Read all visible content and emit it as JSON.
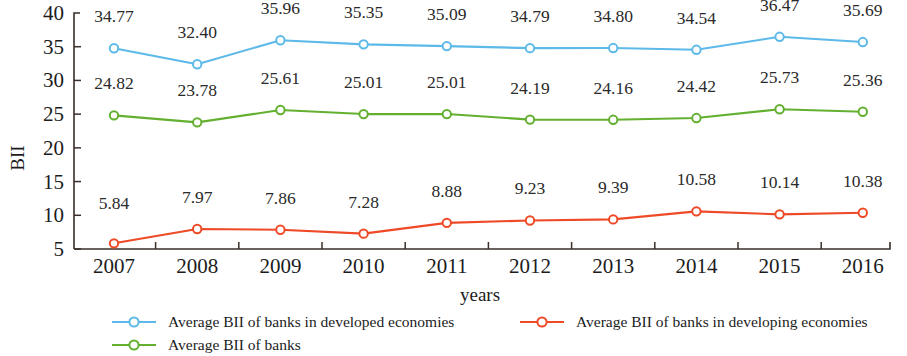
{
  "chart_data": {
    "type": "line",
    "title": "",
    "xlabel": "years",
    "ylabel": "BII",
    "categories": [
      "2007",
      "2008",
      "2009",
      "2010",
      "2011",
      "2012",
      "2013",
      "2014",
      "2015",
      "2016"
    ],
    "ylim": [
      5,
      40
    ],
    "yticks": [
      5,
      10,
      15,
      20,
      25,
      30,
      35,
      40
    ],
    "grid": false,
    "legend_position": "bottom",
    "series": [
      {
        "name": "Average BII of banks in developed economies",
        "color": "#5CB9E8",
        "values": [
          34.77,
          32.4,
          35.96,
          35.35,
          35.09,
          34.79,
          34.8,
          34.54,
          36.47,
          35.69
        ],
        "labels": [
          "34.77",
          "32.40",
          "35.96",
          "35.35",
          "35.09",
          "34.79",
          "34.80",
          "34.54",
          "36.47",
          "35.69"
        ]
      },
      {
        "name": "Average BII of banks in developing economies",
        "color": "#EE4A28",
        "values": [
          5.84,
          7.97,
          7.86,
          7.28,
          8.88,
          9.23,
          9.39,
          10.58,
          10.14,
          10.38
        ],
        "labels": [
          "5.84",
          "7.97",
          "7.86",
          "7.28",
          "8.88",
          "9.23",
          "9.39",
          "10.58",
          "10.14",
          "10.38"
        ]
      },
      {
        "name": "Average BII of banks",
        "color": "#63B030",
        "values": [
          24.82,
          23.78,
          25.61,
          25.01,
          25.01,
          24.19,
          24.16,
          24.42,
          25.73,
          25.36
        ],
        "labels": [
          "24.82",
          "23.78",
          "25.61",
          "25.01",
          "25.01",
          "24.19",
          "24.16",
          "24.42",
          "25.73",
          "25.36"
        ]
      }
    ],
    "legend": [
      {
        "label": "Average BII of banks in developed economies",
        "color": "#5CB9E8"
      },
      {
        "label": "Average BII of banks in developing economies",
        "color": "#EE4A28"
      },
      {
        "label": "Average BII of banks",
        "color": "#63B030"
      }
    ]
  }
}
